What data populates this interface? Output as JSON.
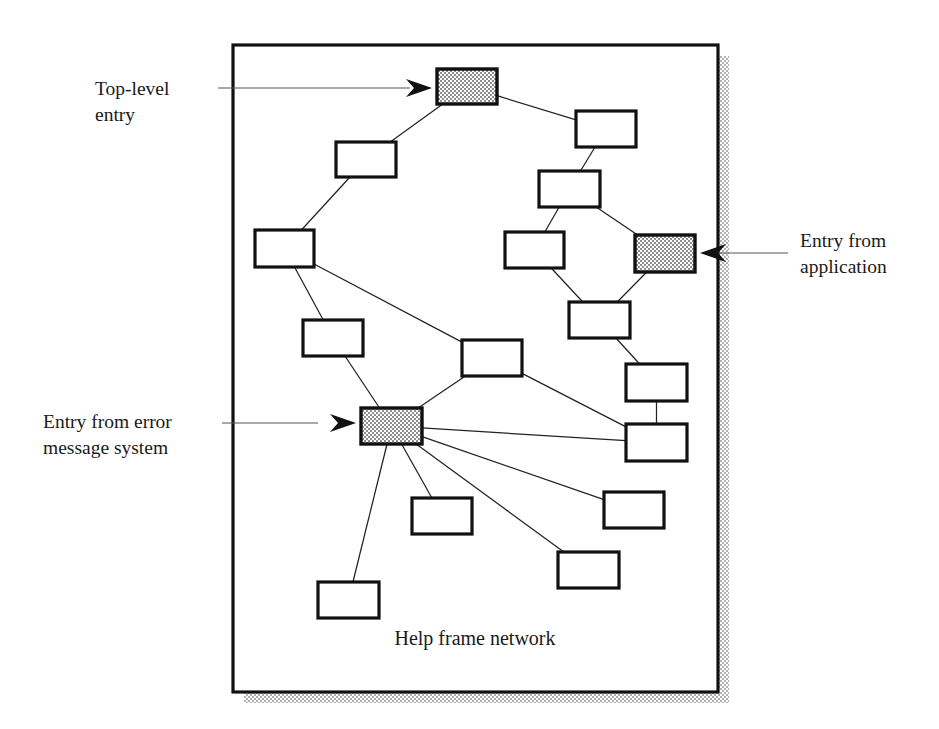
{
  "figure": {
    "caption": "Help frame network",
    "frame": {
      "x": 233,
      "y": 45,
      "width": 485,
      "height": 647
    },
    "shadow_offset": 11,
    "colors": {
      "outline": "#111111",
      "edge_line": "#222222",
      "shaded_fill": "#b8b8b8",
      "plain_fill": "#ffffff",
      "shadow_fill": "#c8c8c8",
      "text": "#1a1a1a",
      "leader_line": "#555555"
    }
  },
  "annotations": [
    {
      "id": "top-level-entry",
      "lines": [
        "Top-level",
        "entry"
      ],
      "text_x": 95,
      "text_y": 95,
      "leader": {
        "x1": 218,
        "y1": 88,
        "x2": 410,
        "y2": 88
      },
      "arrow_dir": "right",
      "arrow_x": 432,
      "arrow_y": 88,
      "target_node": "n1"
    },
    {
      "id": "entry-from-application",
      "lines": [
        "Entry from",
        "application"
      ],
      "text_x": 800,
      "text_y": 247,
      "leader": {
        "x1": 788,
        "y1": 253,
        "x2": 718,
        "y2": 253
      },
      "arrow_dir": "left",
      "arrow_x": 700,
      "arrow_y": 253,
      "target_node": "n9"
    },
    {
      "id": "entry-from-error-message-system",
      "lines": [
        "Entry from error",
        "message system"
      ],
      "text_x": 43,
      "text_y": 428,
      "leader": {
        "x1": 222,
        "y1": 423,
        "x2": 318,
        "y2": 423
      },
      "arrow_dir": "right",
      "arrow_x": 356,
      "arrow_y": 423,
      "target_node": "n12"
    }
  ],
  "nodes": [
    {
      "id": "n1",
      "x": 437,
      "y": 69,
      "w": 60,
      "h": 35,
      "shaded": true,
      "label": "top-level-entry-node"
    },
    {
      "id": "n2",
      "x": 576,
      "y": 111,
      "w": 60,
      "h": 36,
      "shaded": false,
      "label": "node"
    },
    {
      "id": "n3",
      "x": 336,
      "y": 142,
      "w": 60,
      "h": 35,
      "shaded": false,
      "label": "node"
    },
    {
      "id": "n4",
      "x": 539,
      "y": 171,
      "w": 61,
      "h": 36,
      "shaded": false,
      "label": "node"
    },
    {
      "id": "n5",
      "x": 255,
      "y": 230,
      "w": 59,
      "h": 37,
      "shaded": false,
      "label": "node"
    },
    {
      "id": "n6",
      "x": 505,
      "y": 232,
      "w": 59,
      "h": 36,
      "shaded": false,
      "label": "node"
    },
    {
      "id": "n9",
      "x": 635,
      "y": 235,
      "w": 60,
      "h": 37,
      "shaded": true,
      "label": "entry-from-application-node"
    },
    {
      "id": "n7",
      "x": 569,
      "y": 302,
      "w": 61,
      "h": 36,
      "shaded": false,
      "label": "node"
    },
    {
      "id": "n8",
      "x": 303,
      "y": 320,
      "w": 60,
      "h": 36,
      "shaded": false,
      "label": "node"
    },
    {
      "id": "n10",
      "x": 462,
      "y": 340,
      "w": 60,
      "h": 36,
      "shaded": false,
      "label": "center-node"
    },
    {
      "id": "n11",
      "x": 626,
      "y": 364,
      "w": 61,
      "h": 37,
      "shaded": false,
      "label": "node"
    },
    {
      "id": "n12",
      "x": 361,
      "y": 408,
      "w": 61,
      "h": 36,
      "shaded": true,
      "label": "entry-from-error-message-node"
    },
    {
      "id": "n13",
      "x": 626,
      "y": 424,
      "w": 61,
      "h": 37,
      "shaded": false,
      "label": "node"
    },
    {
      "id": "n14",
      "x": 604,
      "y": 492,
      "w": 60,
      "h": 36,
      "shaded": false,
      "label": "node"
    },
    {
      "id": "n15",
      "x": 412,
      "y": 498,
      "w": 60,
      "h": 36,
      "shaded": false,
      "label": "node"
    },
    {
      "id": "n16",
      "x": 558,
      "y": 552,
      "w": 61,
      "h": 36,
      "shaded": false,
      "label": "node"
    },
    {
      "id": "n17",
      "x": 318,
      "y": 582,
      "w": 61,
      "h": 36,
      "shaded": false,
      "label": "node"
    }
  ],
  "edges": [
    {
      "from": "n1",
      "to": "n3"
    },
    {
      "from": "n1",
      "to": "n2"
    },
    {
      "from": "n2",
      "to": "n4"
    },
    {
      "from": "n3",
      "to": "n5"
    },
    {
      "from": "n4",
      "to": "n6"
    },
    {
      "from": "n4",
      "to": "n9"
    },
    {
      "from": "n5",
      "to": "n8"
    },
    {
      "from": "n5",
      "to": "n10"
    },
    {
      "from": "n6",
      "to": "n7"
    },
    {
      "from": "n9",
      "to": "n7"
    },
    {
      "from": "n7",
      "to": "n11"
    },
    {
      "from": "n8",
      "to": "n12"
    },
    {
      "from": "n10",
      "to": "n12"
    },
    {
      "from": "n10",
      "to": "n13"
    },
    {
      "from": "n11",
      "to": "n13"
    },
    {
      "from": "n12",
      "to": "n13"
    },
    {
      "from": "n12",
      "to": "n14"
    },
    {
      "from": "n12",
      "to": "n15"
    },
    {
      "from": "n12",
      "to": "n16"
    },
    {
      "from": "n12",
      "to": "n17"
    }
  ]
}
